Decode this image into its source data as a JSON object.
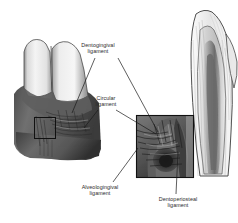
{
  "figure": {
    "background_color": "#ffffff",
    "line_color": "#1a1a1a",
    "text_color": "#2b2b2b"
  },
  "labels": {
    "dentogingival": {
      "line1": "Dentogingival",
      "line2": "ligament"
    },
    "circular": {
      "line1": "Circular",
      "line2": "ligament"
    },
    "alveologingival": {
      "line1": "Alveologingival",
      "line2": "ligament"
    },
    "dentoperiosteal": {
      "line1": "Dentoperiosteal",
      "line2": "ligament"
    }
  },
  "illustrations": {
    "left": {
      "name": "buccal-view-teeth-and-gingiva"
    },
    "center": {
      "name": "magnified-inset-gingival-fibers"
    },
    "right": {
      "name": "sagittal-section-tooth-root"
    }
  },
  "callout_boxes": {
    "small": {
      "name": "left-detail-box"
    },
    "large": {
      "name": "center-inset-box"
    }
  }
}
